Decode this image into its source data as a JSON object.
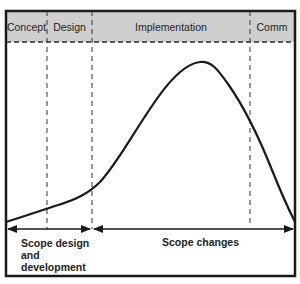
{
  "diagram": {
    "type": "project-lifecycle-scope-curve",
    "colors": {
      "header_fill": "#cfcfcf",
      "frame": "#1a1a1a",
      "curve": "#1a1a1a",
      "dash": "#333333",
      "background": "#ffffff"
    },
    "phases": [
      {
        "label": "Concept"
      },
      {
        "label": "Design"
      },
      {
        "label": "Implementation"
      },
      {
        "label": "Comm"
      }
    ],
    "scope_ranges": [
      {
        "line1": "Scope design",
        "line2": "and",
        "line3": "development"
      },
      {
        "label": "Scope changes"
      }
    ]
  }
}
